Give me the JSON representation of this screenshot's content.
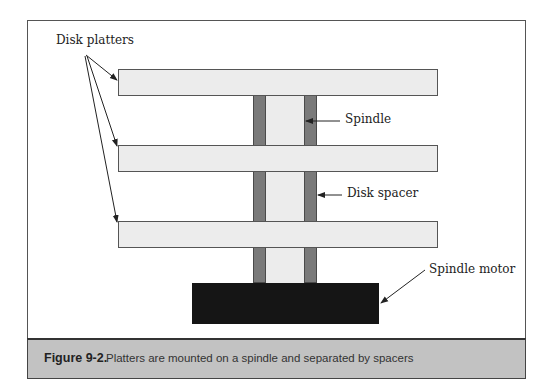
{
  "diagram": {
    "labels": {
      "disk_platters": "Disk platters",
      "spindle": "Spindle",
      "disk_spacer": "Disk spacer",
      "spindle_motor": "Spindle motor"
    },
    "components": {
      "platters": [
        {
          "name": "platter-1"
        },
        {
          "name": "platter-2"
        },
        {
          "name": "platter-3"
        }
      ],
      "spindle": "Spindle",
      "spacers": "Disk spacer",
      "motor": "Spindle motor"
    },
    "colors": {
      "platter_fill": "#ececec",
      "spacer_fill": "#7a7a7a",
      "motor_fill": "#151515",
      "caption_band": "#c2c2c2"
    }
  },
  "caption": {
    "number": "Figure 9-2.",
    "text": "Platters are mounted on a spindle and separated by spacers"
  }
}
